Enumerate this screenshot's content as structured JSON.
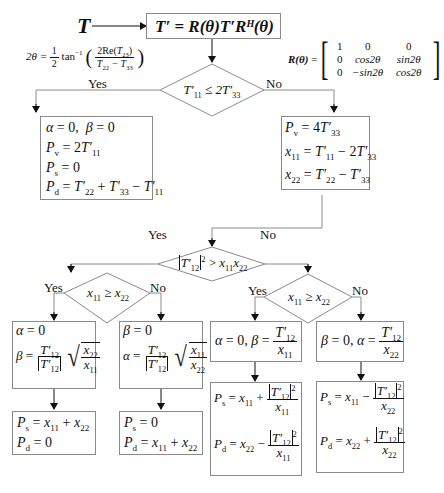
{
  "diagram": {
    "type": "flowchart",
    "input": {
      "symbol": "T"
    },
    "transform_box": {
      "lhs": "T′",
      "rhs": "R(θ)T′Rᴴ(θ)"
    },
    "angle_formula": {
      "lhs": "2θ",
      "coef": "1/2",
      "fn": "tan⁻¹",
      "numerator": "2Re(T₂₃)",
      "denominator": "T₂₂ − T₃₃"
    },
    "rotation_matrix": {
      "lhs": "R(θ)",
      "rows": [
        [
          "1",
          "0",
          "0"
        ],
        [
          "0",
          "cos2θ",
          "sin2θ"
        ],
        [
          "0",
          "−sin2θ",
          "cos2θ"
        ]
      ]
    },
    "decision1": {
      "condition": "T′11 ≤ 2T′33",
      "yes": "Yes",
      "no": "No"
    },
    "box_yes1": {
      "lines": [
        "α = 0,  β = 0",
        "Pv = 2T′11",
        "Ps = 0",
        "Pd = T′22 + T′33 − T′11"
      ]
    },
    "box_no1": {
      "lines": [
        "Pv = 4T′33",
        "x11 = T′11 − 2T′33",
        "x22 = T′22 − T′33"
      ]
    },
    "decision2": {
      "condition": "|T′12|² > x11x22",
      "yes": "Yes",
      "no": "No"
    },
    "decision3_left": {
      "condition": "x11 ≥ x22",
      "yes": "Yes",
      "no": "No"
    },
    "decision3_right": {
      "condition": "x11 ≥ x22",
      "yes": "Yes",
      "no": "No"
    },
    "box_LL": {
      "lines": [
        "α = 0",
        "β = T′12/|T′12| √(x22/x11)"
      ]
    },
    "box_LR": {
      "lines": [
        "β = 0",
        "α = T′12/|T′12| √(x11/x22)"
      ]
    },
    "box_RL": {
      "lines": [
        "α = 0, β = T′12/x11"
      ]
    },
    "box_RR": {
      "lines": [
        "β = 0, α = T′12/x22"
      ]
    },
    "result_LL": {
      "lines": [
        "Ps = x11 + x22",
        "Pd = 0"
      ]
    },
    "result_LR": {
      "lines": [
        "Ps = 0",
        "Pd = x11 + x22"
      ]
    },
    "result_RL": {
      "lines": [
        "Ps = x11 + |T′12|²/x11",
        "Pd = x22 − |T′12|²/x11"
      ]
    },
    "result_RR": {
      "lines": [
        "Ps = x11 − |T′12|²/x22",
        "Pd = x22 + |T′12|²/x22"
      ]
    },
    "labels": {
      "yes": "Yes",
      "no": "No"
    },
    "colors": {
      "line": "#8a8a8a",
      "arrow": "#111111",
      "text": "#111111",
      "background": "#ffffff"
    }
  }
}
